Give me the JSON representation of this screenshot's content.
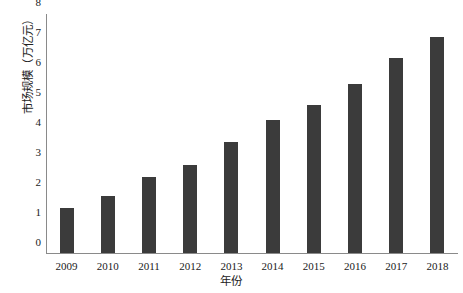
{
  "chart_data": {
    "type": "bar",
    "title": "",
    "xlabel": "年份",
    "ylabel": "市场规模（万亿元）",
    "categories": [
      "2009",
      "2010",
      "2011",
      "2012",
      "2013",
      "2014",
      "2015",
      "2016",
      "2017",
      "2018"
    ],
    "values": [
      1.5,
      1.9,
      2.55,
      2.95,
      3.7,
      4.45,
      4.95,
      5.65,
      6.5,
      7.2
    ],
    "ylim": [
      0,
      8
    ],
    "yticks": [
      0,
      1,
      2,
      3,
      4,
      5,
      6,
      7,
      8
    ],
    "ytick_labels": [
      "0",
      "1",
      "2",
      "3",
      "4",
      "5",
      "6",
      "7",
      "8"
    ],
    "grid": false,
    "legend": null,
    "series": [
      {
        "name": "市场规模",
        "color": "#3b3b3b",
        "values": [
          1.5,
          1.9,
          2.55,
          2.95,
          3.7,
          4.45,
          4.95,
          5.65,
          6.5,
          7.2
        ]
      }
    ]
  }
}
